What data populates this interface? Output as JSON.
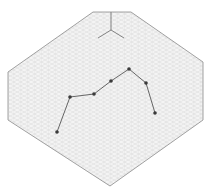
{
  "diagram": {
    "type": "isometric-grid-polyline",
    "background": "#ffffff",
    "grid_color": "#d9d9d9",
    "border_color": "#8a8a8a",
    "line_color": "#555555",
    "point_color": "#3a3a3a",
    "boundary": [
      [
        93,
        12
      ],
      [
        131,
        12
      ],
      [
        203,
        62
      ],
      [
        203,
        120
      ],
      [
        110,
        186
      ],
      [
        8,
        120
      ],
      [
        8,
        72
      ]
    ],
    "axis_origin": [
      111,
      30
    ],
    "axis_ends": [
      [
        111,
        12
      ],
      [
        98,
        38
      ],
      [
        124,
        38
      ]
    ],
    "points": [
      [
        57,
        132
      ],
      [
        70,
        97
      ],
      [
        94,
        94
      ],
      [
        111,
        81
      ],
      [
        129,
        69
      ],
      [
        146,
        83
      ],
      [
        155,
        113
      ]
    ]
  }
}
